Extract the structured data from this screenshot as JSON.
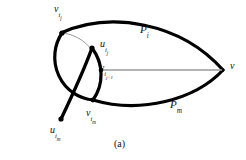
{
  "figure": {
    "caption": "(a)",
    "type": "graph-theory-diagram",
    "colors": {
      "background": "#ffffff",
      "thick_stroke": "#000000",
      "thin_stroke": "#9a9a9a",
      "vertex_dot": "#000000",
      "text": "#111111"
    },
    "labels": {
      "v_ij": {
        "base": "v",
        "sub": "i",
        "subsub": "j",
        "text": "v i j"
      },
      "u_ij": {
        "base": "u",
        "sub": "i",
        "subsub": "j",
        "text": "u i j"
      },
      "v_ij1": {
        "base": "v",
        "sub": "i",
        "subsub": "j+1",
        "text": "v i j+1"
      },
      "v_im": {
        "base": "v",
        "sub": "i",
        "subsub": "m",
        "text": "v i m"
      },
      "u_im": {
        "base": "u",
        "sub": "i",
        "subsub": "m",
        "text": "u i m"
      },
      "P_i": {
        "base": "P",
        "sub": "i",
        "text": "P i"
      },
      "P_m": {
        "base": "P",
        "sub": "m",
        "text": "P m"
      },
      "v": {
        "base": "v",
        "text": "v"
      }
    },
    "vertices": [
      {
        "name": "v_ij",
        "x": 62,
        "y": 33
      },
      {
        "name": "u_ij",
        "x": 92,
        "y": 48
      },
      {
        "name": "v_ij1",
        "x": 102,
        "y": 70
      },
      {
        "name": "v_im",
        "x": 93,
        "y": 100
      },
      {
        "name": "u_im",
        "x": 61,
        "y": 119
      },
      {
        "name": "v",
        "x": 224,
        "y": 70
      }
    ],
    "edges": [
      {
        "name": "circle-thick-arc",
        "style": "thick",
        "from": "v_ij",
        "to": "u_im"
      },
      {
        "name": "circle-thin-arc",
        "style": "thin",
        "from": "v_ij",
        "to": "v_im"
      },
      {
        "name": "circle-right-thick-arc",
        "style": "thick",
        "from": "u_ij",
        "to": "v_im"
      },
      {
        "name": "chord-uij-uim",
        "style": "thick",
        "from": "u_ij",
        "to": "u_im"
      },
      {
        "name": "path-Pi",
        "style": "thick",
        "from": "v_ij",
        "to": "v"
      },
      {
        "name": "path-Pm",
        "style": "thick",
        "from": "v_im",
        "to": "v"
      },
      {
        "name": "segment-vij1-v",
        "style": "thin",
        "from": "v_ij1",
        "to": "v"
      }
    ]
  }
}
